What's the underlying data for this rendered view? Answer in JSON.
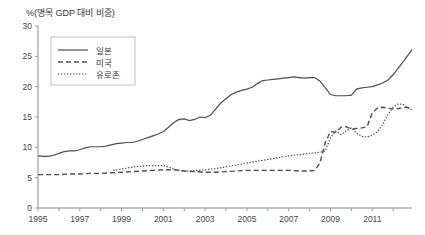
{
  "chart_data": {
    "type": "line",
    "title": "%(명목 GDP 대비 비중)",
    "xlabel": "",
    "ylabel": "%(명목 GDP 대비 비중)",
    "ylim": [
      0,
      30
    ],
    "xlim": [
      1995,
      2012.9
    ],
    "yticks": [
      0,
      5,
      10,
      15,
      20,
      25,
      30
    ],
    "xticks": [
      1995,
      1997,
      1999,
      2001,
      2003,
      2005,
      2007,
      2009,
      2011
    ],
    "xticks_minor": [
      1996,
      1998,
      2000,
      2002,
      2004,
      2006,
      2008,
      2010,
      2012
    ],
    "grid": false,
    "legend_position": "upper-left",
    "series": [
      {
        "name": "일본",
        "style": "solid",
        "color": "#4d4d4d",
        "x": [
          1995,
          1995.25,
          1995.5,
          1995.75,
          1996,
          1996.25,
          1996.5,
          1996.75,
          1997,
          1997.25,
          1997.5,
          1997.75,
          1998,
          1998.25,
          1998.5,
          1998.75,
          1999,
          1999.25,
          1999.5,
          1999.75,
          2000,
          2000.25,
          2000.5,
          2000.75,
          2001,
          2001.25,
          2001.5,
          2001.75,
          2002,
          2002.25,
          2002.5,
          2002.75,
          2003,
          2003.25,
          2003.5,
          2003.75,
          2004,
          2004.25,
          2004.5,
          2004.75,
          2005,
          2005.25,
          2005.5,
          2005.75,
          2006,
          2006.25,
          2006.5,
          2006.75,
          2007,
          2007.25,
          2007.5,
          2007.75,
          2008,
          2008.25,
          2008.5,
          2008.75,
          2009,
          2009.25,
          2009.5,
          2009.75,
          2010,
          2010.25,
          2010.5,
          2010.75,
          2011,
          2011.25,
          2011.5,
          2011.75,
          2012,
          2012.25,
          2012.5,
          2012.9
        ],
        "y": [
          8.6,
          8.5,
          8.5,
          8.7,
          9.0,
          9.3,
          9.4,
          9.4,
          9.6,
          9.9,
          10.1,
          10.1,
          10.1,
          10.2,
          10.4,
          10.6,
          10.7,
          10.8,
          10.8,
          11.0,
          11.3,
          11.6,
          11.9,
          12.2,
          12.6,
          13.3,
          14.1,
          14.6,
          14.7,
          14.4,
          14.6,
          15.0,
          14.9,
          15.3,
          16.3,
          17.3,
          18.0,
          18.7,
          19.1,
          19.4,
          19.6,
          19.9,
          20.5,
          21.0,
          21.1,
          21.2,
          21.3,
          21.4,
          21.5,
          21.6,
          21.5,
          21.4,
          21.5,
          21.5,
          20.9,
          19.8,
          18.7,
          18.5,
          18.5,
          18.5,
          18.6,
          19.6,
          19.8,
          19.9,
          20.0,
          20.3,
          20.6,
          21.1,
          22.0,
          23.1,
          24.2,
          26.1
        ]
      },
      {
        "name": "미국",
        "style": "dashed",
        "color": "#4d4d4d",
        "x": [
          1995,
          1995.5,
          1996,
          1996.5,
          1997,
          1997.5,
          1998,
          1998.5,
          1999,
          1999.5,
          2000,
          2000.5,
          2001,
          2001.5,
          2002,
          2002.5,
          2003,
          2003.5,
          2004,
          2004.5,
          2005,
          2005.5,
          2006,
          2006.5,
          2007,
          2007.5,
          2008,
          2008.25,
          2008.5,
          2008.75,
          2009,
          2009.25,
          2009.5,
          2009.75,
          2010,
          2010.25,
          2010.5,
          2010.75,
          2011,
          2011.25,
          2011.5,
          2011.75,
          2012,
          2012.25,
          2012.5,
          2012.9
        ],
        "y": [
          5.5,
          5.5,
          5.5,
          5.6,
          5.6,
          5.7,
          5.7,
          5.8,
          5.9,
          6.0,
          6.1,
          6.2,
          6.3,
          6.3,
          6.1,
          6.0,
          5.9,
          5.9,
          6.0,
          6.1,
          6.2,
          6.2,
          6.2,
          6.2,
          6.2,
          6.1,
          6.1,
          6.2,
          7.5,
          10.8,
          12.6,
          12.5,
          13.3,
          13.4,
          13.0,
          13.1,
          13.2,
          13.4,
          15.7,
          16.5,
          16.6,
          16.5,
          16.3,
          16.4,
          16.6,
          16.5
        ]
      },
      {
        "name": "유로존",
        "style": "dotted",
        "color": "#4d4d4d",
        "x": [
          1998.6,
          1999,
          1999.3,
          1999.6,
          2000,
          2000.3,
          2000.6,
          2001,
          2001.3,
          2001.6,
          2002,
          2002.3,
          2002.6,
          2003,
          2003.5,
          2004,
          2004.5,
          2005,
          2005.5,
          2006,
          2006.5,
          2007,
          2007.5,
          2008,
          2008.5,
          2008.75,
          2009,
          2009.25,
          2009.5,
          2009.75,
          2010,
          2010.25,
          2010.5,
          2010.75,
          2011,
          2011.25,
          2011.5,
          2011.75,
          2012,
          2012.25,
          2012.5,
          2012.9
        ],
        "y": [
          6.2,
          6.4,
          6.6,
          6.8,
          6.9,
          7.0,
          7.0,
          7.0,
          6.7,
          6.3,
          6.1,
          6.1,
          6.2,
          6.3,
          6.5,
          6.8,
          7.1,
          7.4,
          7.7,
          8.0,
          8.3,
          8.6,
          8.8,
          9.0,
          9.2,
          9.4,
          11.6,
          12.7,
          12.1,
          12.7,
          13.2,
          12.3,
          11.8,
          11.7,
          12.0,
          12.6,
          13.8,
          15.4,
          16.6,
          17.2,
          17.0,
          16.1
        ]
      }
    ]
  },
  "legend": {
    "items": [
      {
        "label": "일본"
      },
      {
        "label": "미국"
      },
      {
        "label": "유로존"
      }
    ]
  }
}
